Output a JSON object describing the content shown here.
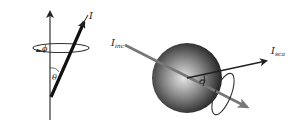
{
  "left_panel": {
    "vector_label": "I",
    "azimuth_label": "ϕ",
    "polar_label": "θ"
  },
  "right_panel": {
    "incident_label": "I",
    "incident_sub": "inc",
    "scattered_label": "I",
    "scattered_sub": "sca",
    "scattering_angle_label": "Θ"
  },
  "colors": {
    "line": "#222222",
    "incident_ray": "#777777",
    "sphere_dark": "#111111",
    "sphere_light": "#e0e0e0"
  }
}
